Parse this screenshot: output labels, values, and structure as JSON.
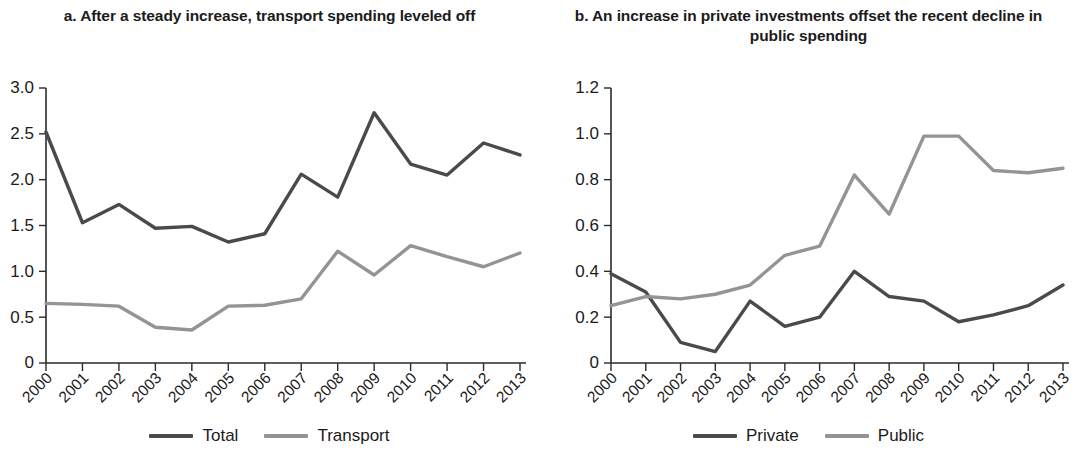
{
  "figure": {
    "panels": [
      {
        "id": "a",
        "title": "a. After a steady increase, transport spending leveled off"
      },
      {
        "id": "b",
        "title": "b. An increase in private investments offset the recent decline in public spending"
      }
    ]
  },
  "colors": {
    "dark_series": "#4a4a4a",
    "light_series": "#949494",
    "axis": "#2a2a2a",
    "text": "#1b1b1b"
  },
  "legend_a": {
    "items": [
      {
        "label": "Total",
        "color": "#4a4a4a"
      },
      {
        "label": "Transport",
        "color": "#949494"
      }
    ]
  },
  "legend_b": {
    "items": [
      {
        "label": "Private",
        "color": "#4a4a4a"
      },
      {
        "label": "Public",
        "color": "#949494"
      }
    ]
  },
  "chart_data": [
    {
      "type": "line",
      "panel": "a",
      "title": "a. After a steady increase, transport spending leveled off",
      "xlabel": "",
      "ylabel": "",
      "categories": [
        "2000",
        "2001",
        "2002",
        "2003",
        "2004",
        "2005",
        "2006",
        "2007",
        "2008",
        "2009",
        "2010",
        "2011",
        "2012",
        "2013"
      ],
      "ytick_labels": [
        "0",
        "0.5",
        "1.0",
        "1.5",
        "2.0",
        "2.5",
        "3.0"
      ],
      "ytick_values": [
        0,
        0.5,
        1.0,
        1.5,
        2.0,
        2.5,
        3.0
      ],
      "ylim": [
        0,
        3.0
      ],
      "grid": false,
      "legend_position": "bottom",
      "series": [
        {
          "name": "Total",
          "color": "#4a4a4a",
          "values": [
            2.52,
            1.53,
            1.73,
            1.47,
            1.49,
            1.32,
            1.41,
            2.06,
            1.81,
            2.73,
            2.17,
            2.05,
            2.4,
            2.27
          ]
        },
        {
          "name": "Transport",
          "color": "#949494",
          "values": [
            0.65,
            0.64,
            0.62,
            0.39,
            0.36,
            0.62,
            0.63,
            0.7,
            1.22,
            0.96,
            1.28,
            1.16,
            1.05,
            1.2
          ]
        }
      ]
    },
    {
      "type": "line",
      "panel": "b",
      "title": "b. An increase in private investments offset the recent decline in public spending",
      "xlabel": "",
      "ylabel": "",
      "categories": [
        "2000",
        "2001",
        "2002",
        "2003",
        "2004",
        "2005",
        "2006",
        "2007",
        "2008",
        "2009",
        "2010",
        "2011",
        "2012",
        "2013"
      ],
      "ytick_labels": [
        "0",
        "0.2",
        "0.4",
        "0.6",
        "0.8",
        "1.0",
        "1.2"
      ],
      "ytick_values": [
        0,
        0.2,
        0.4,
        0.6,
        0.8,
        1.0,
        1.2
      ],
      "ylim": [
        0,
        1.2
      ],
      "grid": false,
      "legend_position": "bottom",
      "series": [
        {
          "name": "Private",
          "color": "#4a4a4a",
          "values": [
            0.39,
            0.31,
            0.09,
            0.05,
            0.27,
            0.16,
            0.2,
            0.4,
            0.29,
            0.27,
            0.18,
            0.21,
            0.25,
            0.34
          ]
        },
        {
          "name": "Public",
          "color": "#949494",
          "values": [
            0.25,
            0.29,
            0.28,
            0.3,
            0.34,
            0.47,
            0.51,
            0.82,
            0.65,
            0.99,
            0.99,
            0.84,
            0.83,
            0.85
          ]
        }
      ]
    }
  ]
}
